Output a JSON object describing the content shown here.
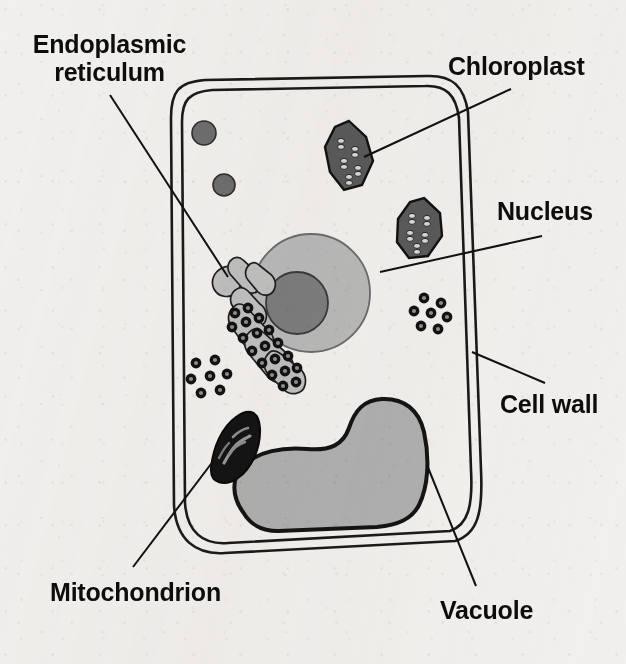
{
  "figure": {
    "background_color": "#f2f0ee",
    "ink_color": "#0d0d0d"
  },
  "labels": [
    {
      "id": "endoplasmic-reticulum",
      "text": "Endoplasmic\nreticulum",
      "x": 22,
      "y": 30,
      "two_line": true,
      "width": 175,
      "leader": {
        "x1": 110,
        "y1": 95,
        "x2": 228,
        "y2": 277
      }
    },
    {
      "id": "chloroplast",
      "text": "Chloroplast",
      "x": 448,
      "y": 52,
      "two_line": false,
      "width": 160,
      "leader": {
        "x1": 511,
        "y1": 89,
        "x2": 364,
        "y2": 157
      }
    },
    {
      "id": "nucleus",
      "text": "Nucleus",
      "x": 497,
      "y": 197,
      "two_line": false,
      "width": 125,
      "leader": {
        "x1": 542,
        "y1": 236,
        "x2": 380,
        "y2": 272
      }
    },
    {
      "id": "cell-wall",
      "text": "Cell wall",
      "x": 500,
      "y": 390,
      "two_line": false,
      "width": 125,
      "leader": {
        "x1": 545,
        "y1": 383,
        "x2": 472,
        "y2": 352
      }
    },
    {
      "id": "mitochondrion",
      "text": "Mitochondrion",
      "x": 50,
      "y": 578,
      "two_line": false,
      "width": 210,
      "leader": {
        "x1": 133,
        "y1": 567,
        "x2": 214,
        "y2": 460
      }
    },
    {
      "id": "vacuole",
      "text": "Vacuole",
      "x": 440,
      "y": 596,
      "two_line": false,
      "width": 125,
      "leader": {
        "x1": 476,
        "y1": 586,
        "x2": 427,
        "y2": 465
      }
    }
  ],
  "organelles": {
    "cell_wall": {
      "name": "cell-wall",
      "outline_color": "#1a1a1a"
    },
    "nucleus": {
      "name": "nucleus",
      "center_x": 311,
      "center_y": 293,
      "radius": 59,
      "fill": "#b9b9b9",
      "nucleolus_radius": 31,
      "nucleolus_fill": "#7d7d7d",
      "nucleolus_center_x": 297,
      "nucleolus_center_y": 303
    },
    "vacuole": {
      "name": "vacuole",
      "fill": "#b0b0b0",
      "outline_color": "#141414"
    },
    "chloroplasts": [
      {
        "name": "chloroplast-upper",
        "center_x": 349,
        "center_y": 155,
        "fill": "#5a5a5a"
      },
      {
        "name": "chloroplast-lower",
        "center_x": 419,
        "center_y": 228,
        "fill": "#5a5a5a"
      }
    ],
    "mitochondrion": {
      "name": "mitochondrion",
      "center_x": 236,
      "center_y": 443,
      "fill": "#141414"
    },
    "endoplasmic_reticulum": {
      "name": "endoplasmic-reticulum",
      "fill": "#c0c0c0"
    },
    "ribosome_clusters": [
      {
        "name": "ribosome-cluster-left",
        "center_x": 210,
        "center_y": 378
      },
      {
        "name": "ribosome-cluster-right",
        "center_x": 428,
        "center_y": 313
      }
    ],
    "small_vesicles": [
      {
        "name": "vesicle-upper",
        "center_x": 204,
        "center_y": 133,
        "radius": 12,
        "fill": "#6e6e6e"
      },
      {
        "name": "vesicle-lower",
        "center_x": 224,
        "center_y": 185,
        "radius": 11,
        "fill": "#6e6e6e"
      }
    ]
  }
}
